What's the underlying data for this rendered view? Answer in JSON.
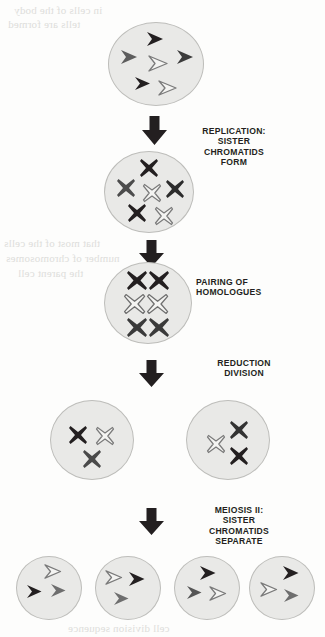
{
  "diagram": {
    "colors": {
      "cell_fill": "#e9e9e7",
      "cell_border": "#bdbdba",
      "chromatid_dark": "#231f20",
      "chromatid_gray": "#6e6e6e",
      "chromatid_white_fill": "#f4f4f2",
      "chromatid_white_stroke": "#7a7a7a",
      "arrow": "#231f20",
      "text": "#231f20",
      "page_background": "#fdfdfc",
      "ghost_text": "#d9d9d6"
    },
    "labels": [
      {
        "id": "replication",
        "text": "REPLICATION:\nSISTER\nCHROMATIDS\nFORM",
        "align": "center"
      },
      {
        "id": "pairing",
        "text": "PAIRING OF\nHOMOLOGUES",
        "align": "left"
      },
      {
        "id": "reduction",
        "text": "REDUCTION\nDIVISION",
        "align": "center"
      },
      {
        "id": "meiosis-two",
        "text": "MEIOSIS II:\nSISTER\nCHROMATIDS\nSEPARATE",
        "align": "center"
      }
    ],
    "stages": [
      {
        "id": "stage-1-parent-cell",
        "name": "Parent cell with unreplicated chromosomes",
        "glyph": "chevron",
        "cells": [
          {
            "id": "cell-parent",
            "chromosomes": [
              {
                "shade": "dark",
                "note": "top center"
              },
              {
                "shade": "dark",
                "note": "left"
              },
              {
                "shade": "white",
                "note": "center"
              },
              {
                "shade": "dark",
                "note": "right"
              },
              {
                "shade": "dark",
                "note": "lower left"
              },
              {
                "shade": "white",
                "note": "lower center"
              }
            ]
          }
        ]
      },
      {
        "id": "stage-2-replicated",
        "name": "Replicated chromosomes as sister chromatids",
        "glyph": "x",
        "cells": [
          {
            "id": "cell-replicated",
            "chromosomes": [
              {
                "shade": "dark",
                "note": "top center"
              },
              {
                "shade": "dark",
                "note": "left"
              },
              {
                "shade": "white",
                "note": "center"
              },
              {
                "shade": "dark",
                "note": "right"
              },
              {
                "shade": "dark",
                "note": "lower left"
              },
              {
                "shade": "white",
                "note": "lower center"
              }
            ]
          }
        ]
      },
      {
        "id": "stage-3-paired",
        "name": "Homologues paired as bivalents",
        "glyph": "xx",
        "cells": [
          {
            "id": "cell-paired",
            "chromosomes": [
              {
                "shade": "dark",
                "note": "top pair"
              },
              {
                "shade": "white",
                "note": "middle pair"
              },
              {
                "shade": "dark",
                "note": "bottom pair"
              }
            ]
          }
        ]
      },
      {
        "id": "stage-4-reduction",
        "name": "Two cells after reduction division",
        "glyph": "x",
        "cells": [
          {
            "id": "cell-reduction-left",
            "chromosomes": [
              {
                "shade": "dark",
                "note": "upper left"
              },
              {
                "shade": "white",
                "note": "upper right"
              },
              {
                "shade": "dark",
                "note": "lower center"
              }
            ]
          },
          {
            "id": "cell-reduction-right",
            "chromosomes": [
              {
                "shade": "dark",
                "note": "upper right"
              },
              {
                "shade": "white",
                "note": "left middle"
              },
              {
                "shade": "dark",
                "note": "lower right"
              }
            ]
          }
        ]
      },
      {
        "id": "stage-5-gametes",
        "name": "Four haploid daughter cells",
        "glyph": "chevron",
        "cells": [
          {
            "id": "cell-gamete-1",
            "chromosomes": [
              {
                "shade": "white",
                "note": "top center"
              },
              {
                "shade": "dark",
                "note": "lower left"
              },
              {
                "shade": "gray",
                "note": "lower right"
              }
            ]
          },
          {
            "id": "cell-gamete-2",
            "chromosomes": [
              {
                "shade": "white",
                "note": "upper left"
              },
              {
                "shade": "dark",
                "note": "upper right"
              },
              {
                "shade": "gray",
                "note": "lower left"
              }
            ]
          },
          {
            "id": "cell-gamete-3",
            "chromosomes": [
              {
                "shade": "dark",
                "note": "top center"
              },
              {
                "shade": "gray",
                "note": "lower left"
              },
              {
                "shade": "white",
                "note": "lower right"
              }
            ]
          },
          {
            "id": "cell-gamete-4",
            "chromosomes": [
              {
                "shade": "dark",
                "note": "upper right"
              },
              {
                "shade": "white",
                "note": "left middle"
              },
              {
                "shade": "gray",
                "note": "lower right"
              }
            ]
          }
        ]
      }
    ],
    "arrows": [
      {
        "id": "arrow-1",
        "direction": "down"
      },
      {
        "id": "arrow-2",
        "direction": "down"
      },
      {
        "id": "arrow-3",
        "direction": "down"
      },
      {
        "id": "arrow-4",
        "direction": "down"
      }
    ],
    "ghost_text": [
      {
        "id": "ghost-top-1",
        "text": "in cells of the body"
      },
      {
        "id": "ghost-top-2",
        "text": "tells are formed"
      },
      {
        "id": "ghost-mid-1",
        "text": "that most of the cells"
      },
      {
        "id": "ghost-mid-2",
        "text": "number of chromosomes"
      },
      {
        "id": "ghost-mid-3",
        "text": "the parent cell"
      },
      {
        "id": "ghost-bottom",
        "text": "cell division sequence"
      }
    ]
  }
}
